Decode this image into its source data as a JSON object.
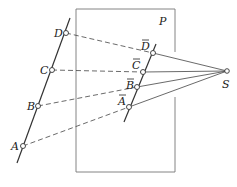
{
  "diagram": {
    "plane_label": "P",
    "center_label": "S",
    "points": [
      {
        "label": "A",
        "x": 23,
        "y": 146,
        "lx": 11,
        "ly": 150
      },
      {
        "label": "B",
        "x": 38,
        "y": 106,
        "lx": 27,
        "ly": 110
      },
      {
        "label": "C",
        "x": 52,
        "y": 70,
        "lx": 40,
        "ly": 74
      },
      {
        "label": "D",
        "x": 66,
        "y": 33,
        "lx": 54,
        "ly": 37
      }
    ],
    "projected_points": [
      {
        "label": "A",
        "x": 129,
        "y": 107,
        "lx": 118,
        "ly": 105
      },
      {
        "label": "B",
        "x": 137,
        "y": 87,
        "lx": 127,
        "ly": 89
      },
      {
        "label": "C",
        "x": 143,
        "y": 72,
        "lx": 132,
        "ly": 68
      },
      {
        "label": "D",
        "x": 153,
        "y": 53,
        "lx": 141,
        "ly": 48
      }
    ],
    "center": {
      "x": 227,
      "y": 71
    },
    "colors": {
      "line": "#333333",
      "frame": "#777777"
    }
  }
}
